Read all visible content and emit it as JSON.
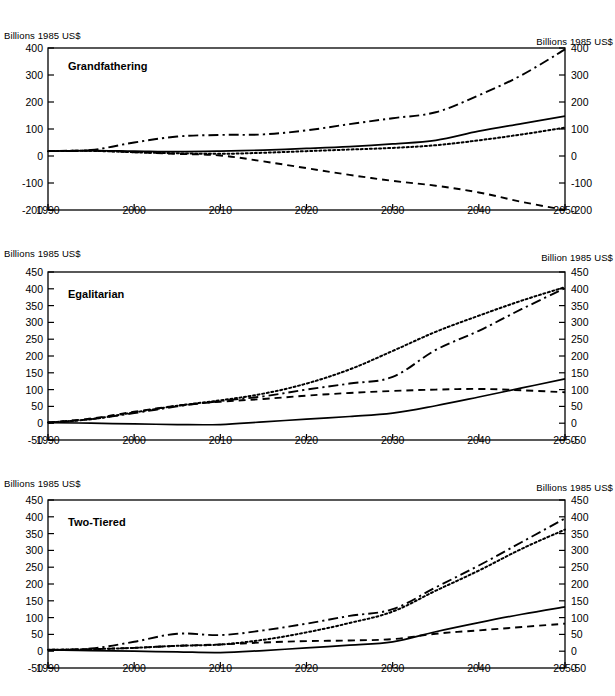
{
  "figure": {
    "axis_label_left": "Billions 1985 US$",
    "panel_count": 3
  },
  "chart_data": [
    {
      "type": "line",
      "title": "Grandfathering",
      "xlabel": "",
      "ylabel": "Billions 1985 US$",
      "y_axis_title_left": "Billions 1985 US$",
      "y_axis_title_right": "Billions 1985 US$",
      "grid": false,
      "legend": "none",
      "xlim": [
        1990,
        2050
      ],
      "ylim": [
        -200,
        400
      ],
      "xticks": [
        1990,
        2000,
        2010,
        2020,
        2030,
        2040,
        2050
      ],
      "xticklabels": [
        "1990",
        "2000",
        "2010",
        "2020",
        "2030",
        "2040",
        "2050"
      ],
      "yticks": [
        -200,
        -100,
        0,
        100,
        200,
        300,
        400
      ],
      "yticklabels": [
        "-200",
        "-100",
        "0",
        "100",
        "200",
        "300",
        "400"
      ],
      "yticklabels_right": [
        "-200",
        "-100",
        "0",
        "100",
        "200",
        "300",
        "400"
      ],
      "x": [
        1990,
        1995,
        2000,
        2005,
        2010,
        2015,
        2020,
        2025,
        2030,
        2035,
        2040,
        2045,
        2050
      ],
      "series": [
        {
          "name": "series-dashdot",
          "style": "dash-dot",
          "values": [
            18,
            22,
            50,
            72,
            78,
            80,
            95,
            118,
            140,
            162,
            225,
            300,
            395
          ]
        },
        {
          "name": "series-solid",
          "style": "solid",
          "values": [
            18,
            20,
            18,
            16,
            18,
            22,
            28,
            35,
            45,
            58,
            92,
            120,
            148
          ]
        },
        {
          "name": "series-dotted",
          "style": "dotted",
          "values": [
            18,
            19,
            14,
            10,
            8,
            12,
            18,
            24,
            30,
            40,
            58,
            80,
            105
          ]
        },
        {
          "name": "series-dashed",
          "style": "dashed",
          "values": [
            18,
            20,
            14,
            8,
            2,
            -20,
            -45,
            -70,
            -92,
            -110,
            -135,
            -170,
            -200
          ]
        }
      ]
    },
    {
      "type": "line",
      "title": "Egalitarian",
      "xlabel": "",
      "ylabel": "Billions 1985 US$",
      "y_axis_title_left": "Billions 1985 US$",
      "y_axis_title_right": "Billion 1985 US$",
      "grid": false,
      "legend": "none",
      "xlim": [
        1990,
        2050
      ],
      "ylim": [
        -50,
        450
      ],
      "xticks": [
        1990,
        2000,
        2010,
        2020,
        2030,
        2040,
        2050
      ],
      "xticklabels": [
        "1990",
        "2000",
        "2010",
        "2020",
        "2030",
        "2040",
        "2050"
      ],
      "yticks": [
        -50,
        0,
        50,
        100,
        150,
        200,
        250,
        300,
        350,
        400,
        450
      ],
      "yticklabels": [
        "-50",
        "0",
        "50",
        "100",
        "150",
        "200",
        "250",
        "300",
        "350",
        "400",
        "450"
      ],
      "yticklabels_right": [
        "-50",
        "0",
        "50",
        "100",
        "150",
        "200",
        "250",
        "300",
        "350",
        "400",
        "450"
      ],
      "x": [
        1990,
        1995,
        2000,
        2005,
        2010,
        2015,
        2020,
        2025,
        2030,
        2035,
        2040,
        2045,
        2050
      ],
      "series": [
        {
          "name": "series-dotted",
          "style": "dotted",
          "values": [
            2,
            12,
            32,
            52,
            68,
            88,
            118,
            160,
            215,
            272,
            320,
            365,
            405
          ]
        },
        {
          "name": "series-dashdot",
          "style": "dash-dot",
          "values": [
            2,
            12,
            30,
            50,
            66,
            80,
            100,
            118,
            138,
            218,
            275,
            340,
            402
          ]
        },
        {
          "name": "series-dashed",
          "style": "dashed",
          "values": [
            2,
            14,
            34,
            52,
            64,
            72,
            82,
            90,
            96,
            100,
            102,
            98,
            92
          ]
        },
        {
          "name": "series-solid",
          "style": "solid",
          "values": [
            2,
            0,
            -2,
            -4,
            -4,
            4,
            12,
            20,
            30,
            52,
            78,
            105,
            132
          ]
        }
      ]
    },
    {
      "type": "line",
      "title": "Two-Tiered",
      "xlabel": "",
      "ylabel": "Billions 1985 US$",
      "y_axis_title_left": "Billions 1985 US$",
      "y_axis_title_right": "Billions 1985 US$",
      "grid": false,
      "legend": "none",
      "xlim": [
        1990,
        2050
      ],
      "ylim": [
        -50,
        450
      ],
      "xticks": [
        1990,
        2000,
        2010,
        2020,
        2030,
        2040,
        2050
      ],
      "xticklabels": [
        "1990",
        "2000",
        "2010",
        "2020",
        "2030",
        "2040",
        "2050"
      ],
      "yticks": [
        -50,
        0,
        50,
        100,
        150,
        200,
        250,
        300,
        350,
        400,
        450
      ],
      "yticklabels": [
        "-50",
        "0",
        "50",
        "100",
        "150",
        "200",
        "250",
        "300",
        "350",
        "400",
        "450"
      ],
      "yticklabels_right": [
        "-50",
        "0",
        "50",
        "100",
        "150",
        "200",
        "250",
        "300",
        "350",
        "400",
        "450"
      ],
      "x": [
        1990,
        1995,
        2000,
        2005,
        2010,
        2015,
        2020,
        2025,
        2030,
        2035,
        2040,
        2045,
        2050
      ],
      "series": [
        {
          "name": "series-dashdot",
          "style": "dash-dot",
          "values": [
            4,
            8,
            28,
            52,
            48,
            62,
            82,
            105,
            125,
            190,
            255,
            325,
            395
          ]
        },
        {
          "name": "series-dotted",
          "style": "dotted",
          "values": [
            4,
            6,
            10,
            16,
            20,
            34,
            56,
            84,
            118,
            180,
            240,
            305,
            362
          ]
        },
        {
          "name": "series-dashed",
          "style": "dashed",
          "values": [
            4,
            6,
            10,
            16,
            20,
            26,
            30,
            32,
            36,
            52,
            62,
            72,
            82
          ]
        },
        {
          "name": "series-solid",
          "style": "solid",
          "values": [
            4,
            2,
            0,
            -2,
            -4,
            2,
            10,
            18,
            28,
            58,
            85,
            110,
            132
          ]
        }
      ]
    }
  ]
}
